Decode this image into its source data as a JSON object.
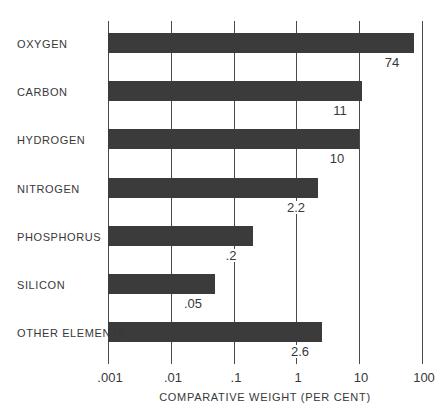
{
  "chart_data": {
    "type": "bar",
    "orientation": "horizontal",
    "x_scale": "log",
    "xlabel": "COMPARATIVE WEIGHT (PER CENT)",
    "xlim": [
      0.001,
      100
    ],
    "x_ticks": [
      ".001",
      ".01",
      ".1",
      "1",
      "10",
      "100"
    ],
    "x_tick_values": [
      0.001,
      0.01,
      0.1,
      1,
      10,
      100
    ],
    "categories": [
      "OXYGEN",
      "CARBON",
      "HYDROGEN",
      "NITROGEN",
      "PHOSPHORUS",
      "SILICON",
      "OTHER ELEMENTS"
    ],
    "values": [
      74,
      11,
      10,
      2.2,
      0.2,
      0.05,
      2.6
    ],
    "value_labels": [
      "74",
      "11",
      "10",
      "2.2",
      ".2",
      ".05",
      "2.6"
    ],
    "grid": true,
    "legend": "none",
    "bar_color": "#3b3b3b",
    "gridline_color": "#4a4a4a",
    "text_color": "#383838"
  }
}
